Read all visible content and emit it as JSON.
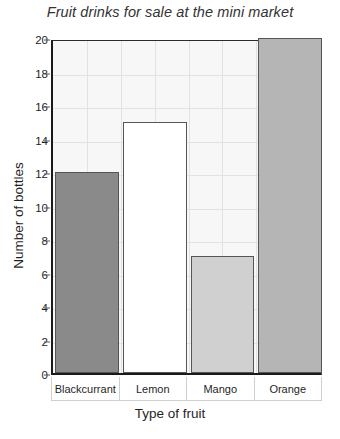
{
  "chart_data": {
    "type": "bar",
    "title": "Fruit drinks for sale at the mini market",
    "xlabel": "Type of fruit",
    "ylabel": "Number of bottles",
    "categories": [
      "Blackcurrant",
      "Lemon",
      "Mango",
      "Orange"
    ],
    "values": [
      12,
      15,
      7,
      20
    ],
    "bar_colors": [
      "#8a8a8a",
      "#ffffff",
      "#d0d0d0",
      "#b5b5b5"
    ],
    "bar_border_color": "#555555",
    "ylim": [
      0,
      20
    ],
    "ytick_step": 2,
    "yticks": [
      0,
      2,
      4,
      6,
      8,
      10,
      12,
      14,
      16,
      18,
      20
    ],
    "ytick_labels": [
      "0",
      "2",
      "4",
      "6",
      "8",
      "10",
      "12",
      "14",
      "16",
      "18",
      "20"
    ],
    "grid": true,
    "grid_color": "#e2e2e2",
    "plot_background": "#f7f7f7",
    "axis_color": "#1a1a1a",
    "legend": null
  }
}
